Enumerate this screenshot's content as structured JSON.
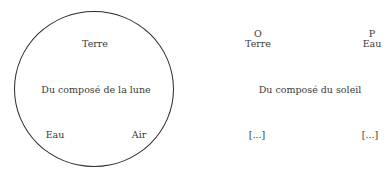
{
  "moon": {
    "title": "Du composé de la lune",
    "top": "Terre",
    "bottom_left": "Eau",
    "bottom_right": "Air"
  },
  "sun": {
    "title": "Du composé du soleil",
    "left_column": {
      "letter": "O",
      "element": "Terre",
      "bottom": "[...]"
    },
    "right_column": {
      "letter": "P",
      "element": "Eau",
      "bottom": "[...]"
    }
  }
}
